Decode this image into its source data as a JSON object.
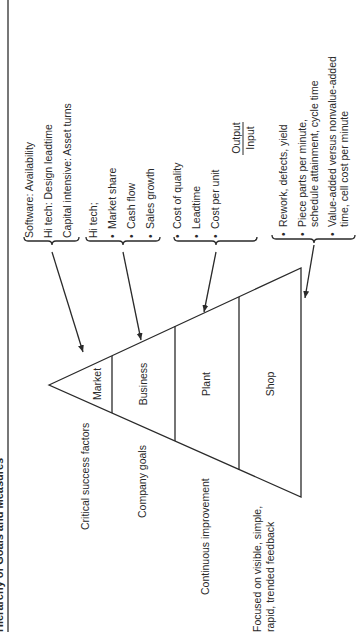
{
  "title": "Hierarchy of Goals and Measures",
  "triangle": {
    "levels": [
      {
        "label": "Market"
      },
      {
        "label": "Business"
      },
      {
        "label": "Plant"
      },
      {
        "label": "Shop"
      }
    ]
  },
  "left_labels": {
    "critical": "Critical success factors",
    "company": "Company goals",
    "continuous": "Continuous improvement",
    "focused_1": "Focused on visible, simple,",
    "focused_2": "rapid, trended feedback"
  },
  "measures": {
    "market": {
      "lines": [
        "Software: Availability",
        "Hi tech: Design leadtime",
        "Capital intensive: Asset turns"
      ]
    },
    "business": {
      "heading": "Hi tech;",
      "bullets": [
        "Market share",
        "Cash flow",
        "Sales growth"
      ]
    },
    "plant": {
      "bullets": [
        "Cost of quality",
        "Leadtime",
        "Cost per unit"
      ],
      "fraction": {
        "numerator": "Output",
        "denominator": "Input"
      }
    },
    "shop": {
      "bullets": [
        {
          "line1": "Rework, defects, yield"
        },
        {
          "line1": "Piece parts per minute,",
          "line2": "schedule attainment, cycle time"
        },
        {
          "line1": "Value-added versus nonvalue-added",
          "line2": "time, cell cost per minute"
        }
      ]
    }
  },
  "bullet_char": "•"
}
